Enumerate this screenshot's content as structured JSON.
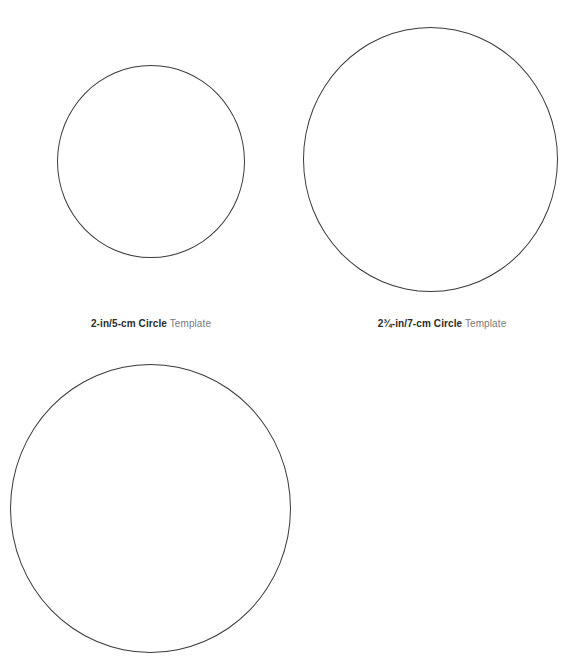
{
  "templates": [
    {
      "id": "small",
      "label_bold": "2-in/5-cm Circle",
      "label_light": "Template"
    },
    {
      "id": "medium",
      "label_bold": "2¾-in/7-cm Circle",
      "label_light": "Template"
    },
    {
      "id": "large",
      "label_bold": "",
      "label_light": ""
    }
  ],
  "colors": {
    "stroke": "#3a3a3a",
    "label_bold": "#2b2b2b",
    "label_light": "#7a7a7a",
    "background": "#ffffff"
  }
}
